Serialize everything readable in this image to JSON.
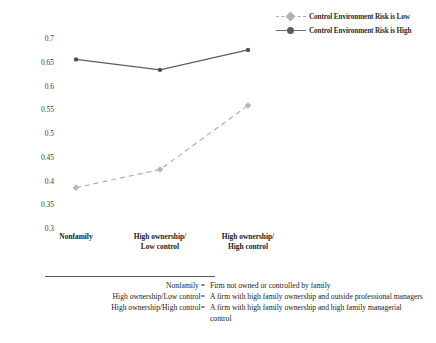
{
  "chart_data": {
    "type": "line",
    "title": "",
    "xlabel": "",
    "ylabel": "",
    "categories": [
      "Nonfamily",
      "High ownership/\nLow control",
      "High ownership/\nHigh control"
    ],
    "category_labels": [
      {
        "line1": "Nonfamily",
        "line2": ""
      },
      {
        "line1": "High ownership/",
        "line2": "Low control"
      },
      {
        "line1": "High ownership/",
        "line2": "High control"
      }
    ],
    "series": [
      {
        "name": "Control Environment Risk is Low",
        "values": [
          0.385,
          0.423,
          0.558
        ],
        "style": "dashed",
        "marker": "diamond",
        "color": "#a8a8a8"
      },
      {
        "name": "Control Environment Risk is High",
        "values": [
          0.655,
          0.633,
          0.675
        ],
        "style": "solid",
        "marker": "circle",
        "color": "#5c5c5c"
      }
    ],
    "ylim": [
      0.3,
      0.7
    ],
    "yticks": [
      0.7,
      0.65,
      0.6,
      0.55,
      0.5,
      0.45,
      0.4,
      0.35,
      0.3
    ],
    "ytick_labels": [
      "0.7",
      "0.65",
      "0.6",
      "0.55",
      "0.5",
      "0.45",
      "0.4",
      "0.35",
      "0.3"
    ],
    "grid": false,
    "legend_position": "top-right"
  },
  "legend": {
    "items": [
      {
        "label": "Control Environment Risk is Low"
      },
      {
        "label": "Control Environment Risk is High"
      }
    ]
  },
  "notes": [
    {
      "term": "Nonfamily =",
      "definition": "Firm not owned or controlled by family"
    },
    {
      "term": "High ownership/Low control=",
      "definition": "A firm with high family ownership and outside professional managers"
    },
    {
      "term": "High ownership/High control=",
      "definition": "A firm with high family ownership and high family managerial control"
    }
  ]
}
